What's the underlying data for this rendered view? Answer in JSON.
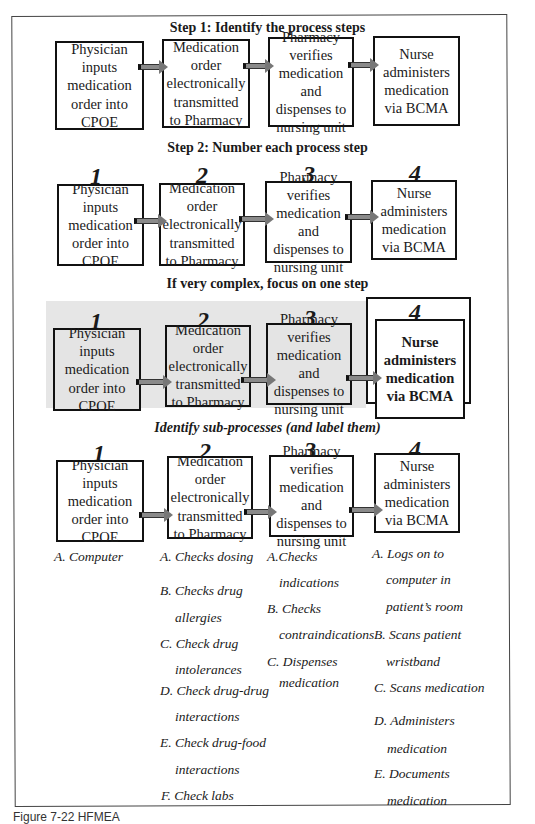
{
  "headings": {
    "step1": "Step 1: Identify the process steps",
    "step2": "Step 2: Number each process step",
    "focus": "If very complex, focus on one step",
    "subprocesses": "Identify sub-processes (and label them)"
  },
  "steps": [
    {
      "number": "1",
      "label": "Physician inputs medication order into CPOE"
    },
    {
      "number": "2",
      "label": "Medication order electronically transmitted to Pharmacy"
    },
    {
      "number": "3",
      "label": "Pharmacy verifies medication and dispenses to nursing unit"
    },
    {
      "number": "4",
      "label": "Nurse administers medication via BCMA"
    }
  ],
  "focus_step_label": "Nurse administers medication via BCMA",
  "subprocesses": {
    "step1": [
      "A.  Computer"
    ],
    "step2": [
      "A. Checks dosing",
      "B. Checks drug",
      "allergies",
      "C. Check drug",
      "intolerances",
      "D. Check drug-drug",
      "interactions",
      "E. Check drug-food",
      "interactions",
      "F. Check labs"
    ],
    "step3": [
      "A.Checks",
      "indications",
      "B. Checks",
      "contraindications",
      "C. Dispenses",
      "medication"
    ],
    "step4": [
      "A. Logs on to",
      "computer in",
      "patient’s room",
      "B. Scans patient",
      "wristband",
      "C. Scans medication",
      "D. Administers",
      "medication",
      "E. Documents",
      "medication"
    ]
  },
  "caption": "Figure 7-22  HFMEA"
}
